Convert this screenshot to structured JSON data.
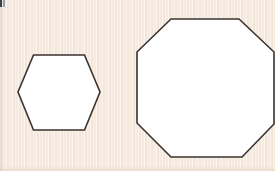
{
  "page": {
    "width": 275,
    "height": 171,
    "background_color": "#f8ece0",
    "paper_texture": "vertical-stripes",
    "artifact_label": "scan-edge-artifact"
  },
  "palette": {
    "background": "#f8ece0",
    "shape_fill": "#ffffff",
    "shape_stroke": "#3a3330",
    "artifact_dark": "#2b2f3a",
    "artifact_light": "#8f99ad"
  },
  "shapes": [
    {
      "id": "hexagon",
      "name": "hexagon",
      "sides": 6,
      "orientation": "pointy-left-right",
      "fill": "#ffffff",
      "stroke": "#3a3330",
      "stroke_width": 1.6,
      "center": {
        "x": 59,
        "y": 92
      },
      "width": 83,
      "height": 76,
      "points": "33.5,55 84.5,55 100,92 84.5,130 33.5,130 18,92"
    },
    {
      "id": "octagon",
      "name": "octagon",
      "sides": 8,
      "orientation": "flat-top",
      "clipped": "right-edge",
      "fill": "#ffffff",
      "stroke": "#3a3330",
      "stroke_width": 1.6,
      "center": {
        "x": 205,
        "y": 88
      },
      "width": 137,
      "height": 138,
      "points": "171,19 239,19 274,52 274,124 242,157 171,157 137,123 137,52"
    }
  ],
  "chart_data": {
    "type": "diagram",
    "items": [
      {
        "label": "hexagon",
        "sides": 6,
        "relative_size": "small"
      },
      {
        "label": "octagon",
        "sides": 8,
        "relative_size": "large"
      }
    ]
  }
}
